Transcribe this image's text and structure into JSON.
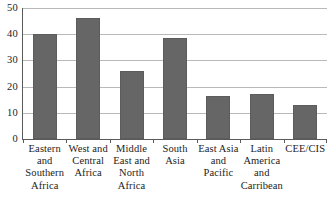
{
  "chart_data": {
    "type": "bar",
    "title": "",
    "subtitle": "",
    "xlabel": "",
    "ylabel": "",
    "ylim": [
      0,
      50
    ],
    "yticks": [
      0,
      10,
      20,
      30,
      40,
      50
    ],
    "ytick_labels": [
      "0",
      "10",
      "20",
      "30",
      "40",
      "50"
    ],
    "grid": true,
    "legend": false,
    "legend_position": "none",
    "categories": [
      "Eastern and Southern Africa",
      "West and Central Africa",
      "Middle East and North Africa",
      "South Asia",
      "East Asia and Pacific",
      "Latin America and Carribean",
      "CEE/CIS"
    ],
    "category_lines": [
      [
        "Eastern",
        "and",
        "Southern",
        "Africa"
      ],
      [
        "West and",
        "Central",
        "Africa"
      ],
      [
        "Middle",
        "East and",
        "North",
        "Africa"
      ],
      [
        "South Asia"
      ],
      [
        "East Asia",
        "and",
        "Pacific"
      ],
      [
        "Latin",
        "America",
        "and",
        "Carribean"
      ],
      [
        "CEE/CIS"
      ]
    ],
    "values": [
      40,
      46,
      26,
      38.5,
      16.5,
      17,
      13
    ],
    "bar_color": "#666666",
    "gridline_color": "#b9b9b9",
    "axis_color": "#5a5a5a"
  }
}
